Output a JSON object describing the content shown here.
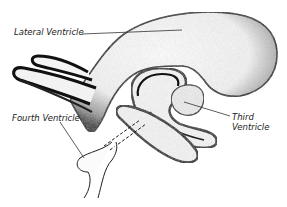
{
  "diagram": {
    "labels": {
      "lateral": "Lateral Ventricle",
      "fourth": "Fourth Ventricle",
      "third_line1": "Third",
      "third_line2": "Ventricle"
    },
    "colors": {
      "ink": "#111111",
      "stipple": "#555555",
      "background": "#ffffff"
    }
  }
}
